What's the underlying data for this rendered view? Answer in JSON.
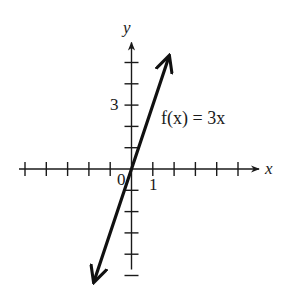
{
  "chart_data": {
    "type": "line",
    "title": "",
    "xlabel": "x",
    "ylabel": "y",
    "xlim": [
      -5,
      5
    ],
    "ylim": [
      -5,
      5
    ],
    "grid": false,
    "x_ticks": [
      -5,
      -4,
      -3,
      -2,
      -1,
      1,
      2,
      3,
      4,
      5
    ],
    "y_ticks": [
      -5,
      -4,
      -3,
      -2,
      -1,
      1,
      2,
      3,
      4,
      5
    ],
    "tick_labels": {
      "origin": "0",
      "x": [
        {
          "value": 1,
          "label": "1"
        }
      ],
      "y": [
        {
          "value": 3,
          "label": "3"
        }
      ]
    },
    "series": [
      {
        "name": "f(x) = 3x",
        "slope": 3,
        "intercept": 0,
        "x": [
          -1.75,
          1.75
        ],
        "y": [
          -5.25,
          5.25
        ],
        "arrows": "both"
      }
    ],
    "annotations": [
      {
        "text": "f(x) = 3x",
        "x": 1.4,
        "y": 3
      }
    ],
    "x_axis_arrow": "positive",
    "y_axis_arrow": "positive"
  }
}
